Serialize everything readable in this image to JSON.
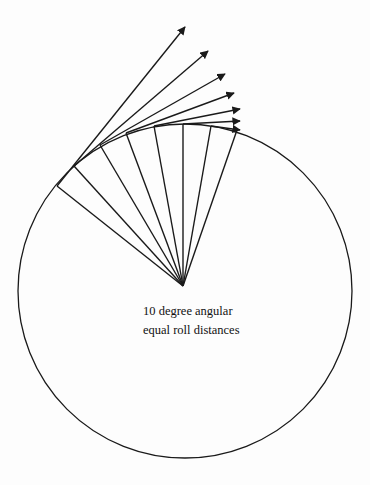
{
  "diagram": {
    "caption": {
      "line1": "10 degree angular",
      "line2": "equal roll distances"
    },
    "stroke_color": "#1a1a1a",
    "circle": {
      "cx": 185,
      "cy": 291,
      "r": 167
    },
    "hub": {
      "x": 183,
      "y": 286
    },
    "rim_points": [
      [
        57,
        186
      ],
      [
        74,
        166
      ],
      [
        100,
        145
      ],
      [
        126,
        133
      ],
      [
        154,
        126
      ],
      [
        183,
        124
      ],
      [
        211,
        126
      ],
      [
        237,
        130
      ]
    ],
    "arrow_tips": [
      [
        185,
        27
      ],
      [
        208,
        51
      ],
      [
        225,
        74
      ],
      [
        234,
        93
      ],
      [
        240,
        109
      ],
      [
        240,
        121
      ],
      [
        240,
        130
      ]
    ]
  }
}
